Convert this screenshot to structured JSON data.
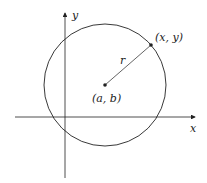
{
  "diagram": {
    "labels": {
      "y_axis": "y",
      "x_axis": "x",
      "point": "(x, y)",
      "center": "(a, b)",
      "radius": "r"
    },
    "colors": {
      "stroke": "#222222",
      "background": "#ffffff"
    }
  }
}
